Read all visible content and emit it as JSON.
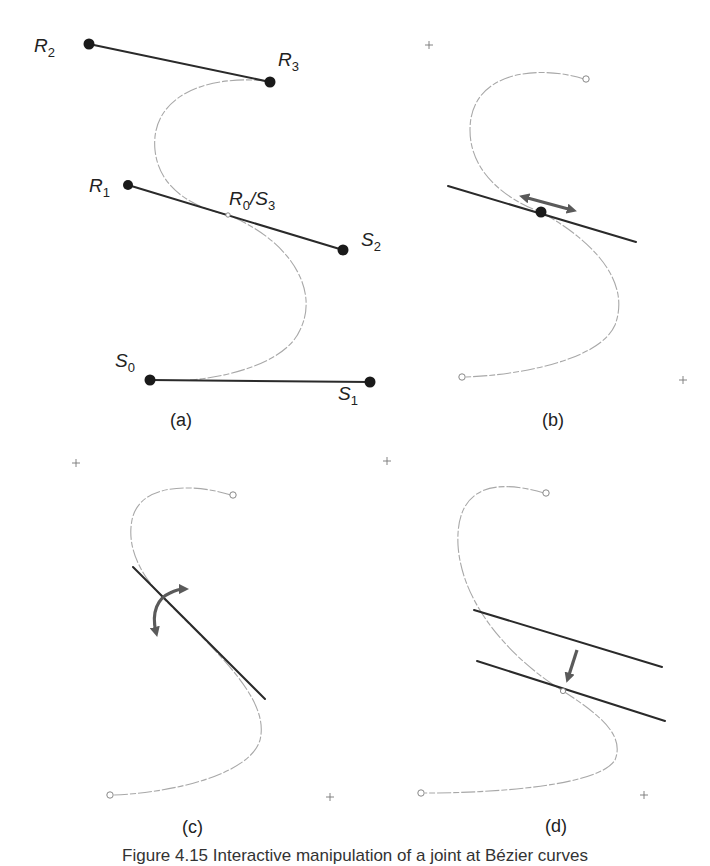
{
  "figure": {
    "panels": [
      {
        "id": "a",
        "label": "(a)",
        "description": "Two cubic Bézier segments R and S joined at R0/S3 with control polygons"
      },
      {
        "id": "b",
        "label": "(b)",
        "description": "Sliding the joint point along the tangent line"
      },
      {
        "id": "c",
        "label": "(c)",
        "description": "Rotating the tangent line about the joint"
      },
      {
        "id": "d",
        "label": "(d)",
        "description": "Translating the tangent line"
      }
    ],
    "point_labels": {
      "R2": {
        "base": "R",
        "sub": "2"
      },
      "R3": {
        "base": "R",
        "sub": "3"
      },
      "R1": {
        "base": "R",
        "sub": "1"
      },
      "R0S3": {
        "base1": "R",
        "sub1": "0",
        "sep": "/",
        "base2": "S",
        "sub2": "3"
      },
      "S2": {
        "base": "S",
        "sub": "2"
      },
      "S0": {
        "base": "S",
        "sub": "0"
      },
      "S1": {
        "base": "S",
        "sub": "1"
      }
    },
    "caption": "Figure 4.15  Interactive manipulation of a joint at Bézier curves"
  },
  "colors": {
    "curve": "#a8a8a8",
    "tangent": "#2a2a2a",
    "arrow": "#5a5a5a",
    "point": "#1a1a1a"
  }
}
